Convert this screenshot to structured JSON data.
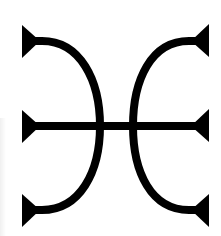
{
  "symbol": {
    "name": "double-arc symbol with barbed terminals",
    "stroke_color": "#000000",
    "background_color": "#ffffff",
    "parts": {
      "left_arc": "left-arc",
      "right_arc": "right-arc",
      "crossbar": "horizontal-crossbar",
      "barbs": [
        "top-left",
        "middle-left",
        "bottom-left",
        "top-right",
        "middle-right",
        "bottom-right"
      ]
    }
  }
}
